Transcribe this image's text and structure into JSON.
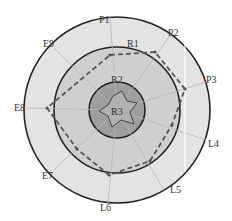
{
  "diagram": {
    "center": {
      "x": 117,
      "y": 110
    },
    "rings": [
      {
        "name": "R1",
        "radius": 93,
        "fill": "#e3e3e3"
      },
      {
        "name": "R2",
        "radius": 63,
        "fill": "#cfcfcf"
      },
      {
        "name": "R3",
        "radius": 28,
        "fill": "#9e9e9e"
      }
    ],
    "ring_labels": [
      {
        "text": "R1",
        "x": 133,
        "y": 47
      },
      {
        "text": "R2",
        "x": 117,
        "y": 83
      },
      {
        "text": "R3",
        "x": 117,
        "y": 115
      }
    ],
    "axes": [
      {
        "label": "P1",
        "x": 104,
        "y": 23
      },
      {
        "label": "P2",
        "x": 174,
        "y": 36
      },
      {
        "label": "P3",
        "x": 212,
        "y": 83
      },
      {
        "label": "L4",
        "x": 214,
        "y": 147
      },
      {
        "label": "L5",
        "x": 176,
        "y": 193
      },
      {
        "label": "L6",
        "x": 106,
        "y": 211
      },
      {
        "label": "E7",
        "x": 48,
        "y": 179
      },
      {
        "label": "E8",
        "x": 20,
        "y": 111
      },
      {
        "label": "E9",
        "x": 49,
        "y": 47
      }
    ],
    "outer_polygon_points": "110,55 155,52 185,89 172,125 150,161 109,175 77,149 47,108",
    "inner_star_points": "113,96 122,91 127,101 137,103 130,112 134,124 121,120 112,127 108,116 99,111 108,105",
    "colors": {
      "outline": "#222222",
      "spoke": "#b5b5b5",
      "dashed": "#555555",
      "highlight_line": "#ffffff"
    }
  }
}
